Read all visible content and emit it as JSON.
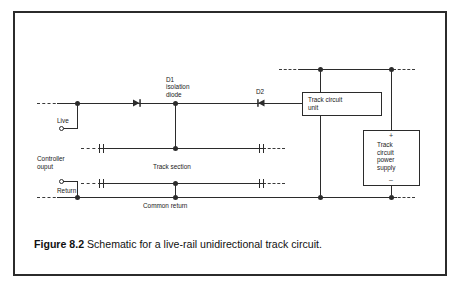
{
  "figure": {
    "caption_label": "Figure 8.2",
    "caption_text": "Schematic for a live-rail unidirectional track circuit."
  },
  "diagram": {
    "type": "circuit-schematic",
    "components": {
      "diode_d1": {
        "designator": "D1",
        "description": "isolation\ndiode",
        "orientation": "right"
      },
      "diode_d2": {
        "designator": "D2",
        "orientation": "left"
      },
      "track_circuit_unit": {
        "label": "Track circuit\nunit"
      },
      "track_circuit_power_supply": {
        "label": "Track\ncircuit\npower\nsupply",
        "positive_terminal": "+",
        "negative_terminal": "–"
      }
    },
    "labels": {
      "live": "Live",
      "controller_output": "Controller\nouput",
      "return": "Return",
      "track_section": "Track section",
      "common_return": "Common return"
    },
    "colors": {
      "line": "#2b2b2b",
      "text": "#1a1a1a",
      "background": "#ffffff",
      "frame": "#2b2b2b"
    }
  }
}
